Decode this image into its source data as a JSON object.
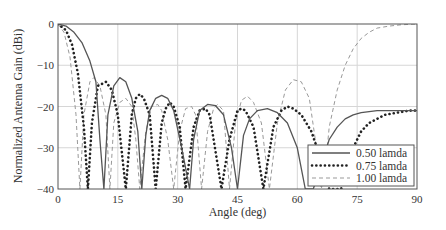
{
  "chart_data": {
    "type": "line",
    "title": "",
    "xlabel": "Angle (deg)",
    "ylabel": "Normalized Antenna Gain (dBi)",
    "xlim": [
      0,
      90
    ],
    "ylim": [
      -40,
      0
    ],
    "xticks": [
      0,
      15,
      30,
      45,
      60,
      75,
      90
    ],
    "yticks": [
      0,
      -10,
      -20,
      -30,
      -40
    ],
    "grid": true,
    "legend_position": "lower right",
    "series": [
      {
        "name": "0.50 lamda",
        "style": "solid",
        "color": "#555555",
        "x": [
          0,
          2,
          4,
          6,
          8,
          9.5,
          10.5,
          11.5,
          12.5,
          14,
          15.5,
          17,
          18.5,
          20,
          21,
          22,
          23,
          24.5,
          26,
          27.5,
          29,
          31,
          33,
          34,
          35.5,
          37.5,
          39.5,
          41.5,
          43.5,
          45,
          46.5,
          48,
          50,
          52.5,
          55,
          57.5,
          60,
          62,
          63,
          64,
          66,
          68,
          70,
          72,
          74,
          76,
          80,
          85,
          90
        ],
        "y": [
          0,
          -0.5,
          -2,
          -4.5,
          -9,
          -14,
          -28,
          -40,
          -22,
          -15,
          -13,
          -14,
          -18,
          -26,
          -40,
          -27,
          -21,
          -18,
          -17.3,
          -18,
          -21,
          -30,
          -40,
          -28,
          -21,
          -19.5,
          -19.8,
          -22,
          -30,
          -40,
          -27,
          -23,
          -21,
          -20.5,
          -21.5,
          -24,
          -30,
          -40,
          -40,
          -40,
          -34,
          -28,
          -25,
          -23,
          -22,
          -21.5,
          -21,
          -21,
          -21
        ]
      },
      {
        "name": "0.75 lamda",
        "style": "dotted",
        "color": "#222222",
        "x": [
          0,
          2,
          3.5,
          5,
          6.5,
          7.5,
          8.5,
          10,
          12,
          13.5,
          15,
          17,
          18.5,
          19.5,
          20.5,
          21.5,
          23,
          24.5,
          26,
          27,
          28,
          29,
          30.5,
          32,
          34,
          35.5,
          37,
          38,
          39,
          41,
          43,
          45,
          46,
          47,
          49,
          51.5,
          54,
          56,
          57.5,
          59,
          61,
          63.5,
          66,
          68,
          69.5,
          71,
          72.5,
          74,
          75,
          76,
          78,
          80,
          82,
          85,
          88,
          90
        ],
        "y": [
          0,
          -1.5,
          -5,
          -12,
          -25,
          -40,
          -24,
          -15,
          -14,
          -16,
          -22,
          -40,
          -22,
          -18,
          -17,
          -18,
          -22,
          -40,
          -24,
          -20.5,
          -19,
          -20,
          -25,
          -40,
          -25,
          -21,
          -20.5,
          -22,
          -28,
          -40,
          -28,
          -21,
          -20.5,
          -21,
          -25,
          -40,
          -25,
          -21,
          -20,
          -20.5,
          -22,
          -26,
          -33,
          -40,
          -40,
          -40,
          -35,
          -30,
          -28,
          -26,
          -24,
          -23,
          -22,
          -21.5,
          -21,
          -21
        ]
      },
      {
        "name": "1.00 lamda",
        "style": "dashed",
        "color": "#999999",
        "x": [
          0,
          1.5,
          3,
          4.5,
          5.5,
          6.5,
          8,
          9,
          10.5,
          12,
          13,
          14,
          15.5,
          17,
          18.5,
          19.5,
          20.5,
          22,
          23.5,
          25,
          26,
          27.5,
          29,
          30.5,
          32,
          33.5,
          34.5,
          36,
          37.5,
          39,
          40,
          41.5,
          43,
          44.5,
          46,
          47.5,
          49,
          51,
          53,
          55,
          57,
          59,
          61,
          63,
          64.5,
          66,
          67,
          68,
          70,
          72,
          74,
          76,
          78,
          80,
          83,
          86,
          90
        ],
        "y": [
          0,
          -2,
          -8,
          -22,
          -40,
          -22,
          -14,
          -13,
          -15,
          -22,
          -40,
          -24,
          -19,
          -18,
          -20,
          -28,
          -40,
          -26,
          -20,
          -19.5,
          -21,
          -28,
          -40,
          -26,
          -20.5,
          -20,
          -22,
          -40,
          -26,
          -20.5,
          -19.5,
          -21,
          -40,
          -24,
          -18.5,
          -17.5,
          -19,
          -24,
          -40,
          -24,
          -16,
          -13.5,
          -14,
          -18,
          -28,
          -40,
          -35,
          -25,
          -16,
          -10,
          -6,
          -3.5,
          -2,
          -1,
          -0.5,
          -0.2,
          0
        ]
      }
    ]
  }
}
